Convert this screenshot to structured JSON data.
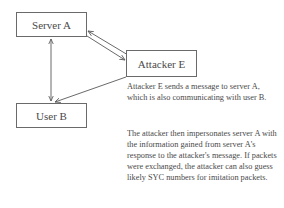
{
  "diagram": {
    "nodes": {
      "server_a": {
        "label": "Server A"
      },
      "attacker_e": {
        "label": "Attacker E"
      },
      "user_b": {
        "label": "User B"
      }
    },
    "edges": [
      {
        "from": "server_a",
        "to": "user_b",
        "type": "bidirectional"
      },
      {
        "from": "server_a",
        "to": "attacker_e",
        "type": "directed"
      },
      {
        "from": "attacker_e",
        "to": "server_a",
        "type": "directed"
      },
      {
        "from": "attacker_e",
        "to": "user_b",
        "type": "directed"
      }
    ],
    "description": {
      "paragraph_1": "Attacker E sends a message to server A, which is also communicating with user B.",
      "paragraph_2": "The attacker then impersonates server A with the information gained from server A's response to the attacker's message. If packets were exchanged, the attacker can also guess likely SYC numbers for imitation packets."
    },
    "colors": {
      "line": "#6a6a6a",
      "text": "#4a4a4a",
      "background": "#ffffff"
    }
  }
}
